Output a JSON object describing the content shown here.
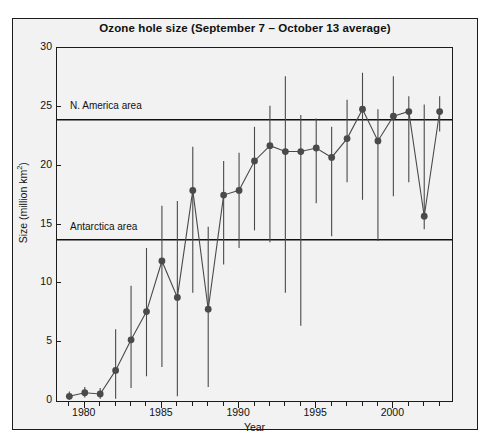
{
  "chart_data": {
    "type": "line",
    "title": "Ozone hole size (September 7 – October 13 average)",
    "subtitle": "",
    "xlabel": "Year",
    "ylabel": "Size (million km²)",
    "ylabel_base": "Size (million km",
    "ylabel_exponent": "2",
    "ylabel_close": ")",
    "xlim": [
      1978.2,
      2003.8
    ],
    "ylim": [
      0,
      30
    ],
    "grid": false,
    "legend_position": "none",
    "marker": "filled-circle",
    "errorbars": true,
    "series_color": "#4a4a4a",
    "axis_color": "#1c1c1c",
    "plot_background": "#f2f2f2",
    "y_ticks": [
      0,
      5,
      10,
      15,
      20,
      25,
      30
    ],
    "y_tick_labels": [
      "0",
      "5",
      "10",
      "15",
      "20",
      "25",
      "30"
    ],
    "x_ticks": [
      1980,
      1985,
      1990,
      1995,
      2000
    ],
    "x_tick_labels": [
      "1980",
      "1985",
      "1990",
      "1995",
      "2000"
    ],
    "x_minor_ticks": [
      1979,
      1981,
      1982,
      1983,
      1984,
      1986,
      1987,
      1988,
      1989,
      1991,
      1992,
      1993,
      1994,
      1996,
      1997,
      1998,
      1999,
      2001,
      2002,
      2003
    ],
    "reference_lines": [
      {
        "label": "N. America area",
        "value": 23.9,
        "color": "#111111"
      },
      {
        "label": "Antarctica area",
        "value": 13.7,
        "color": "#111111"
      }
    ],
    "series": [
      {
        "name": "Ozone hole size",
        "x": [
          1979,
          1980,
          1981,
          1982,
          1983,
          1984,
          1985,
          1986,
          1987,
          1988,
          1989,
          1990,
          1991,
          1992,
          1993,
          1994,
          1995,
          1996,
          1997,
          1998,
          1999,
          2000,
          2001,
          2002,
          2003
        ],
        "values": [
          0.4,
          0.7,
          0.6,
          2.6,
          5.2,
          7.6,
          11.9,
          8.8,
          17.9,
          7.8,
          17.5,
          17.9,
          20.4,
          21.7,
          21.2,
          21.2,
          21.5,
          20.7,
          22.3,
          24.8,
          22.1,
          24.2,
          24.6,
          15.7,
          24.6
        ],
        "err_low": [
          0.1,
          0.3,
          0.2,
          0.2,
          1.1,
          2.1,
          2.9,
          0.4,
          9.2,
          1.2,
          11.6,
          13.0,
          14.5,
          13.5,
          9.2,
          6.4,
          16.8,
          14.0,
          18.6,
          17.1,
          13.6,
          17.4,
          18.6,
          14.6,
          22.9
        ],
        "err_high": [
          0.8,
          1.2,
          1.1,
          6.1,
          9.8,
          13.0,
          16.6,
          17.0,
          21.6,
          14.8,
          20.4,
          21.1,
          23.3,
          25.1,
          27.6,
          24.3,
          24.0,
          23.3,
          25.6,
          27.9,
          24.8,
          27.6,
          25.9,
          25.2,
          25.9
        ]
      }
    ]
  }
}
